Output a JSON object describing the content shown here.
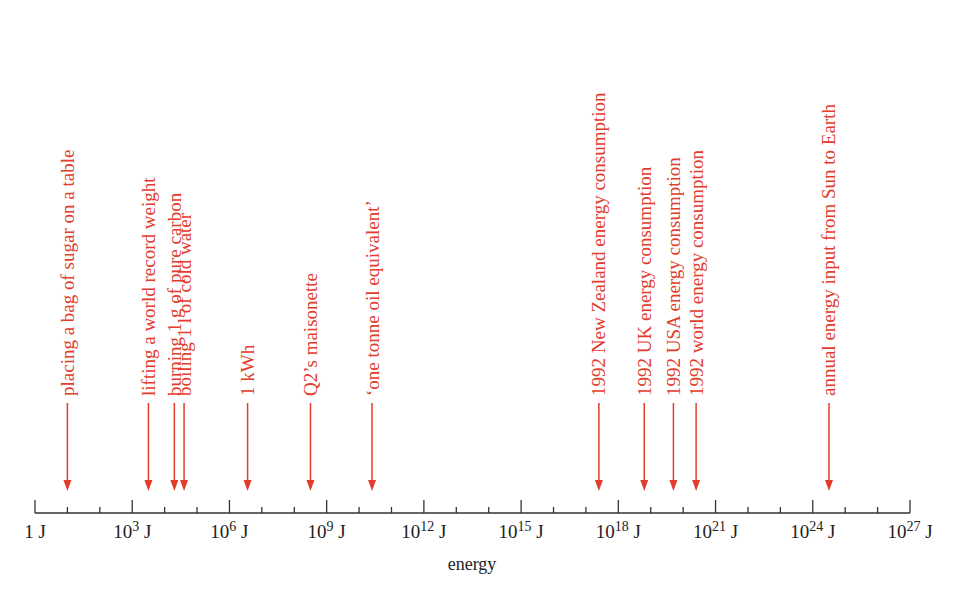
{
  "chart_data": {
    "type": "scale",
    "scale": "log10",
    "unit": "J",
    "xlim_log10": [
      0,
      27
    ],
    "xlabel": "energy",
    "major_ticks": [
      {
        "exp": 0,
        "base": "1",
        "sup": "",
        "unit": "J"
      },
      {
        "exp": 3,
        "base": "10",
        "sup": "3",
        "unit": "J"
      },
      {
        "exp": 6,
        "base": "10",
        "sup": "6",
        "unit": "J"
      },
      {
        "exp": 9,
        "base": "10",
        "sup": "9",
        "unit": "J"
      },
      {
        "exp": 12,
        "base": "10",
        "sup": "12",
        "unit": "J"
      },
      {
        "exp": 15,
        "base": "10",
        "sup": "15",
        "unit": "J"
      },
      {
        "exp": 18,
        "base": "10",
        "sup": "18",
        "unit": "J"
      },
      {
        "exp": 21,
        "base": "10",
        "sup": "21",
        "unit": "J"
      },
      {
        "exp": 24,
        "base": "10",
        "sup": "24",
        "unit": "J"
      },
      {
        "exp": 27,
        "base": "10",
        "sup": "27",
        "unit": "J"
      }
    ],
    "minor_tick_step_decades": 1,
    "annotations": [
      {
        "label": "placing a bag of sugar on a table",
        "log10_energy": 1.0
      },
      {
        "label": "lifting a world record weight",
        "log10_energy": 3.5
      },
      {
        "label": "burning 1 g of pure carbon",
        "log10_energy": 4.3
      },
      {
        "label": "boiling 1 l of cold water",
        "log10_energy": 4.6
      },
      {
        "label": "1 kWh",
        "log10_energy": 6.56
      },
      {
        "label": "Q2’s maisonette",
        "log10_energy": 8.5
      },
      {
        "label": "‘one tonne oil equivalent’",
        "log10_energy": 10.4
      },
      {
        "label": "1992 New Zealand energy consumption",
        "log10_energy": 17.4
      },
      {
        "label": "1992 UK energy consumption",
        "log10_energy": 18.8
      },
      {
        "label": "1992 USA energy consumption",
        "log10_energy": 19.7
      },
      {
        "label": "1992 world energy consumption",
        "log10_energy": 20.4
      },
      {
        "label": "annual energy input from Sun to Earth",
        "log10_energy": 24.5
      }
    ]
  },
  "colors": {
    "annotation": "#e23c2c",
    "axis": "#333333"
  }
}
